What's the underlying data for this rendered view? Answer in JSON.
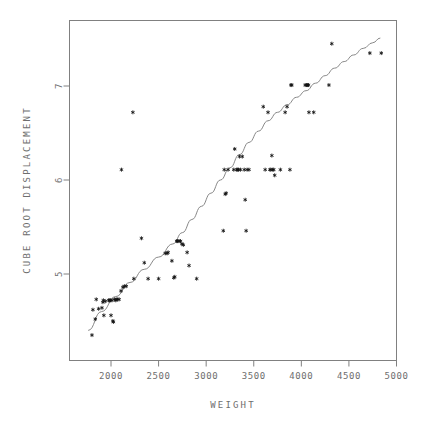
{
  "chart_data": {
    "type": "scatter",
    "title": "",
    "xlabel": "WEIGHT",
    "ylabel": "CUBE ROOT DISPLACEMENT",
    "xlim": [
      1700,
      5000
    ],
    "ylim": [
      4.25,
      7.6
    ],
    "xticks": [
      2000,
      2500,
      3000,
      3500,
      4000,
      4500,
      5000
    ],
    "xticklabels": [
      "2000",
      "2500",
      "3000",
      "3500",
      "4000",
      "4500",
      "5000"
    ],
    "yticks": [
      5,
      6,
      7
    ],
    "yticklabels": [
      "5",
      "6",
      "7"
    ],
    "grid": false,
    "legend": null,
    "marker": "asterisk",
    "marker_color": "#111111",
    "frame_color": "#808080",
    "fit_color": "#7a7a7a",
    "fit_label": "smoothed fit curve",
    "points": [
      [
        1800,
        4.35
      ],
      [
        1810,
        4.62
      ],
      [
        1835,
        4.52
      ],
      [
        1845,
        4.73
      ],
      [
        1870,
        4.63
      ],
      [
        1905,
        4.64
      ],
      [
        1915,
        4.7
      ],
      [
        1920,
        4.72
      ],
      [
        1925,
        4.56
      ],
      [
        1940,
        4.71
      ],
      [
        1975,
        4.72
      ],
      [
        1985,
        4.72
      ],
      [
        1995,
        4.72
      ],
      [
        2000,
        4.56
      ],
      [
        2010,
        4.72
      ],
      [
        2020,
        4.5
      ],
      [
        2025,
        4.49
      ],
      [
        2035,
        4.73
      ],
      [
        2050,
        4.72
      ],
      [
        2055,
        4.73
      ],
      [
        2070,
        4.73
      ],
      [
        2085,
        4.73
      ],
      [
        2105,
        4.82
      ],
      [
        2110,
        6.11
      ],
      [
        2125,
        4.86
      ],
      [
        2140,
        4.87
      ],
      [
        2160,
        4.87
      ],
      [
        2230,
        6.72
      ],
      [
        2240,
        4.95
      ],
      [
        2320,
        5.38
      ],
      [
        2350,
        5.12
      ],
      [
        2390,
        4.95
      ],
      [
        2500,
        4.95
      ],
      [
        2570,
        5.22
      ],
      [
        2590,
        5.22
      ],
      [
        2600,
        5.23
      ],
      [
        2640,
        5.14
      ],
      [
        2660,
        4.96
      ],
      [
        2670,
        4.97
      ],
      [
        2690,
        5.35
      ],
      [
        2700,
        5.35
      ],
      [
        2715,
        5.35
      ],
      [
        2730,
        5.35
      ],
      [
        2745,
        5.32
      ],
      [
        2760,
        5.31
      ],
      [
        2800,
        5.23
      ],
      [
        2820,
        5.09
      ],
      [
        2900,
        4.95
      ],
      [
        3180,
        5.46
      ],
      [
        3190,
        6.11
      ],
      [
        3200,
        5.85
      ],
      [
        3210,
        5.86
      ],
      [
        3230,
        6.11
      ],
      [
        3290,
        6.11
      ],
      [
        3300,
        6.33
      ],
      [
        3320,
        6.11
      ],
      [
        3330,
        6.11
      ],
      [
        3340,
        6.11
      ],
      [
        3350,
        6.25
      ],
      [
        3360,
        6.11
      ],
      [
        3380,
        6.25
      ],
      [
        3400,
        6.11
      ],
      [
        3410,
        5.79
      ],
      [
        3420,
        5.46
      ],
      [
        3430,
        6.11
      ],
      [
        3450,
        6.11
      ],
      [
        3600,
        6.78
      ],
      [
        3620,
        6.11
      ],
      [
        3650,
        6.72
      ],
      [
        3670,
        6.11
      ],
      [
        3680,
        6.11
      ],
      [
        3690,
        6.26
      ],
      [
        3700,
        6.11
      ],
      [
        3710,
        6.11
      ],
      [
        3720,
        6.05
      ],
      [
        3780,
        6.11
      ],
      [
        3830,
        6.72
      ],
      [
        3850,
        6.78
      ],
      [
        3880,
        6.11
      ],
      [
        3890,
        7.01
      ],
      [
        3900,
        7.01
      ],
      [
        4040,
        7.01
      ],
      [
        4055,
        7.01
      ],
      [
        4065,
        7.01
      ],
      [
        4075,
        7.01
      ],
      [
        4080,
        6.72
      ],
      [
        4130,
        6.72
      ],
      [
        4290,
        7.01
      ],
      [
        4320,
        7.45
      ],
      [
        4720,
        7.35
      ],
      [
        4840,
        7.35
      ]
    ],
    "fit_curve": [
      [
        1760,
        4.4
      ],
      [
        1900,
        4.6
      ],
      [
        2050,
        4.76
      ],
      [
        2200,
        4.91
      ],
      [
        2350,
        5.05
      ],
      [
        2500,
        5.18
      ],
      [
        2650,
        5.32
      ],
      [
        2750,
        5.44
      ],
      [
        2850,
        5.58
      ],
      [
        2950,
        5.72
      ],
      [
        3050,
        5.86
      ],
      [
        3150,
        6.0
      ],
      [
        3250,
        6.13
      ],
      [
        3350,
        6.27
      ],
      [
        3450,
        6.4
      ],
      [
        3550,
        6.52
      ],
      [
        3650,
        6.63
      ],
      [
        3750,
        6.72
      ],
      [
        3850,
        6.8
      ],
      [
        3950,
        6.88
      ],
      [
        4050,
        6.95
      ],
      [
        4150,
        7.03
      ],
      [
        4250,
        7.11
      ],
      [
        4350,
        7.19
      ],
      [
        4450,
        7.26
      ],
      [
        4550,
        7.33
      ],
      [
        4650,
        7.4
      ],
      [
        4750,
        7.46
      ],
      [
        4830,
        7.51
      ]
    ]
  }
}
